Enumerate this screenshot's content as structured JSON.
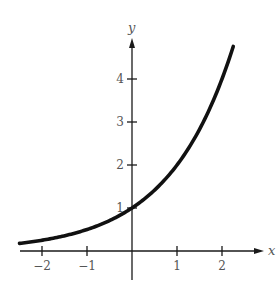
{
  "chart_data": {
    "type": "line",
    "title": "",
    "xlabel": "x",
    "ylabel": "y",
    "function": "y = 2^x",
    "xlim": [
      -2.5,
      2.25
    ],
    "ylim": [
      0,
      4.75
    ],
    "x_ticks": [
      -2,
      -1,
      1,
      2
    ],
    "x_tick_labels": [
      "−2",
      "−1",
      "1",
      "2"
    ],
    "y_ticks": [
      1,
      2,
      3,
      4
    ],
    "y_tick_labels": [
      "1",
      "2",
      "3",
      "4"
    ],
    "grid": false,
    "legend": null,
    "series": [
      {
        "name": "y = 2^x",
        "x": [
          -2.5,
          -2,
          -1.5,
          -1,
          -0.5,
          0,
          0.5,
          1,
          1.5,
          2,
          2.25
        ],
        "values": [
          0.18,
          0.25,
          0.35,
          0.5,
          0.71,
          1,
          1.41,
          2,
          2.83,
          4,
          4.76
        ]
      }
    ],
    "annotations": [
      "curve passes through (0, 1)"
    ]
  },
  "layout": {
    "origin_px": [
      132,
      251
    ],
    "px_per_x": 45,
    "px_per_y": 43,
    "x_axis_px": [
      20,
      264
    ],
    "y_axis_px": [
      280,
      38
    ],
    "curve_color": "#111111",
    "axis_color": "#1a1a1a",
    "label_color": "#555555"
  }
}
